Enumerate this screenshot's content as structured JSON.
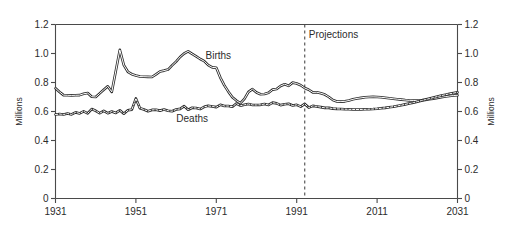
{
  "chart_data": {
    "type": "line",
    "title": "",
    "subtitle": "",
    "xlabel": "",
    "ylabel": "Millions",
    "ylabel_right": "Millions",
    "xlim": [
      1931,
      2031
    ],
    "ylim": [
      0,
      1.2
    ],
    "grid": false,
    "legend_position": "inline-annotation",
    "x_ticks": [
      "1931",
      "1951",
      "1971",
      "1991",
      "2011",
      "2031"
    ],
    "x_tick_values": [
      1931,
      1951,
      1971,
      1991,
      2011,
      2031
    ],
    "y_ticks": [
      "0",
      "0.2",
      "0.4",
      "0.6",
      "0.8",
      "1.0",
      "1.2"
    ],
    "y_tick_values": [
      0,
      0.2,
      0.4,
      0.6,
      0.8,
      1.0,
      1.2
    ],
    "annotations": [
      {
        "name": "projections-divider",
        "label": "Projections",
        "x_value": 1993,
        "style": "vertical-dashed-line"
      }
    ],
    "series": [
      {
        "name": "Births",
        "label": "Births",
        "label_x": 1971.5,
        "label_y": 0.965,
        "style": "solid-outline",
        "x": [
          1931,
          1932,
          1933,
          1934,
          1935,
          1936,
          1937,
          1938,
          1939,
          1940,
          1941,
          1942,
          1943,
          1944,
          1945,
          1946,
          1947,
          1948,
          1949,
          1950,
          1951,
          1952,
          1953,
          1954,
          1955,
          1956,
          1957,
          1958,
          1959,
          1960,
          1961,
          1962,
          1963,
          1964,
          1965,
          1966,
          1967,
          1968,
          1969,
          1970,
          1971,
          1972,
          1973,
          1974,
          1975,
          1976,
          1977,
          1978,
          1979,
          1980,
          1981,
          1982,
          1983,
          1984,
          1985,
          1986,
          1987,
          1988,
          1989,
          1990,
          1991,
          1992,
          1993,
          1994,
          1995,
          1996,
          1997,
          1998,
          1999,
          2000,
          2001,
          2002,
          2003,
          2004,
          2005,
          2006,
          2007,
          2008,
          2009,
          2010,
          2011,
          2012,
          2013,
          2014,
          2015,
          2016,
          2017,
          2018,
          2019,
          2020,
          2021,
          2022,
          2023,
          2024,
          2025,
          2026,
          2027,
          2028,
          2029,
          2030,
          2031
        ],
        "values": [
          0.76,
          0.735,
          0.713,
          0.712,
          0.711,
          0.712,
          0.713,
          0.722,
          0.727,
          0.702,
          0.7,
          0.725,
          0.75,
          0.774,
          0.735,
          0.88,
          1.025,
          0.92,
          0.874,
          0.857,
          0.848,
          0.841,
          0.84,
          0.839,
          0.838,
          0.856,
          0.876,
          0.882,
          0.889,
          0.918,
          0.944,
          0.976,
          1.0,
          1.015,
          0.997,
          0.98,
          0.962,
          0.947,
          0.92,
          0.904,
          0.902,
          0.834,
          0.78,
          0.737,
          0.698,
          0.675,
          0.657,
          0.687,
          0.735,
          0.754,
          0.731,
          0.719,
          0.721,
          0.729,
          0.751,
          0.755,
          0.776,
          0.788,
          0.777,
          0.799,
          0.793,
          0.781,
          0.762,
          0.75,
          0.732,
          0.733,
          0.726,
          0.717,
          0.7,
          0.679,
          0.669,
          0.668,
          0.67,
          0.676,
          0.684,
          0.69,
          0.694,
          0.698,
          0.7,
          0.701,
          0.7,
          0.698,
          0.695,
          0.691,
          0.688,
          0.685,
          0.682,
          0.679,
          0.677,
          0.676,
          0.676,
          0.677,
          0.68,
          0.684,
          0.689,
          0.694,
          0.699,
          0.703,
          0.707,
          0.71,
          0.712
        ]
      },
      {
        "name": "Deaths",
        "label": "Deaths",
        "label_x": 1965.0,
        "label_y": 0.53,
        "style": "dashed-core-outline",
        "x": [
          1931,
          1932,
          1933,
          1934,
          1935,
          1936,
          1937,
          1938,
          1939,
          1940,
          1941,
          1942,
          1943,
          1944,
          1945,
          1946,
          1947,
          1948,
          1949,
          1950,
          1951,
          1952,
          1953,
          1954,
          1955,
          1956,
          1957,
          1958,
          1959,
          1960,
          1961,
          1962,
          1963,
          1964,
          1965,
          1966,
          1967,
          1968,
          1969,
          1970,
          1971,
          1972,
          1973,
          1974,
          1975,
          1976,
          1977,
          1978,
          1979,
          1980,
          1981,
          1982,
          1983,
          1984,
          1985,
          1986,
          1987,
          1988,
          1989,
          1990,
          1991,
          1992,
          1993,
          1994,
          1995,
          1996,
          1997,
          1998,
          1999,
          2000,
          2001,
          2002,
          2003,
          2004,
          2005,
          2006,
          2007,
          2008,
          2009,
          2010,
          2011,
          2012,
          2013,
          2014,
          2015,
          2016,
          2017,
          2018,
          2019,
          2020,
          2021,
          2022,
          2023,
          2024,
          2025,
          2026,
          2027,
          2028,
          2029,
          2030,
          2031
        ],
        "values": [
          0.579,
          0.583,
          0.579,
          0.586,
          0.58,
          0.594,
          0.587,
          0.601,
          0.587,
          0.617,
          0.605,
          0.588,
          0.604,
          0.588,
          0.6,
          0.59,
          0.608,
          0.585,
          0.608,
          0.613,
          0.69,
          0.623,
          0.614,
          0.602,
          0.611,
          0.612,
          0.606,
          0.613,
          0.605,
          0.602,
          0.614,
          0.618,
          0.637,
          0.612,
          0.626,
          0.624,
          0.617,
          0.632,
          0.639,
          0.635,
          0.63,
          0.646,
          0.638,
          0.638,
          0.633,
          0.655,
          0.64,
          0.646,
          0.652,
          0.645,
          0.645,
          0.646,
          0.652,
          0.645,
          0.661,
          0.656,
          0.644,
          0.65,
          0.653,
          0.641,
          0.646,
          0.634,
          0.652,
          0.627,
          0.639,
          0.635,
          0.63,
          0.625,
          0.625,
          0.62,
          0.618,
          0.617,
          0.616,
          0.615,
          0.614,
          0.614,
          0.614,
          0.615,
          0.616,
          0.617,
          0.619,
          0.622,
          0.625,
          0.629,
          0.633,
          0.638,
          0.643,
          0.649,
          0.655,
          0.661,
          0.668,
          0.675,
          0.682,
          0.689,
          0.696,
          0.703,
          0.71,
          0.716,
          0.722,
          0.727,
          0.732
        ]
      }
    ]
  },
  "axes": {
    "left_title": "Millions",
    "right_title": "Millions"
  }
}
